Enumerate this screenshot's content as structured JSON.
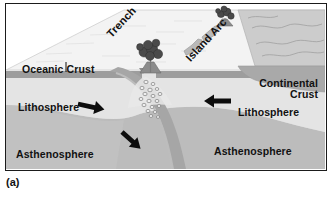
{
  "figure": {
    "caption": "(a)",
    "labels": {
      "oceanic_crust": "Oceanic Crust",
      "trench": "Trench",
      "island_arc": "Island Arc",
      "continental_crust_line1": "Continental",
      "continental_crust_line2": "Crust",
      "lithosphere_left": "Lithosphere",
      "lithosphere_right": "Lithosphere",
      "asthenosphere_left": "Asthenosphere",
      "asthenosphere_right": "Asthenosphere"
    },
    "icons": {
      "plate_motion_arrow_left": "arrow-right-icon",
      "plate_motion_arrow_right": "arrow-left-icon",
      "subduction_arrow": "arrow-down-right-icon",
      "volcano_main": "volcano-icon",
      "volcano_arc_far": "volcano-icon",
      "island_near": "island-icon",
      "island_far": "island-icon",
      "magma_plume": "magma-bubbles-icon",
      "leader_line_oceanic_crust": "leader-line-icon"
    },
    "colors": {
      "frame_border": "#1b1b1b",
      "background": "#ffffff",
      "ocean_surface": "#f4f4f4",
      "continent_surface": "#cfcfcf",
      "crust_band": "#9c9c9c",
      "lithosphere": "#e2e2e2",
      "asthenosphere": "#bdbdbd",
      "slab": "#a8a8a8",
      "arrow": "#101010",
      "text": "#111111"
    }
  }
}
